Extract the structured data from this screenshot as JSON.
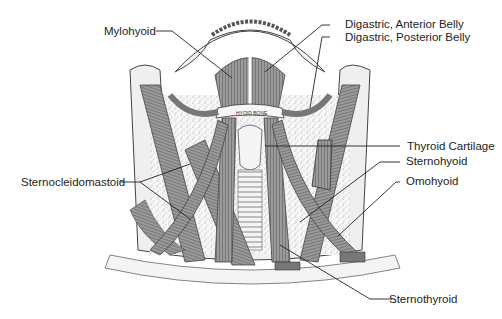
{
  "figure": {
    "inline_text": {
      "hyoid_bone": "HYOID BONE"
    },
    "labels": [
      {
        "id": "mylohyoid",
        "text": "Mylohyoid",
        "side": "left"
      },
      {
        "id": "digastric-anterior",
        "text": "Digastric, Anterior Belly",
        "side": "right"
      },
      {
        "id": "digastric-posterior",
        "text": "Digastric, Posterior Belly",
        "side": "right"
      },
      {
        "id": "thyroid-cartilage",
        "text": "Thyroid Cartilage",
        "side": "right"
      },
      {
        "id": "sternohyoid",
        "text": "Sternohyoid",
        "side": "right"
      },
      {
        "id": "omohyoid",
        "text": "Omohyoid",
        "side": "right"
      },
      {
        "id": "sternocleidomastoid",
        "text": "Sternocleidomastoid",
        "side": "left"
      },
      {
        "id": "sternothyroid",
        "text": "Sternothyroid",
        "side": "right"
      }
    ],
    "colors": {
      "muscle": "#8a8a8a",
      "muscle_dark": "#555555",
      "bone": "#f2f2f2",
      "stipple": "#bbbbbb",
      "line": "#222222"
    }
  }
}
